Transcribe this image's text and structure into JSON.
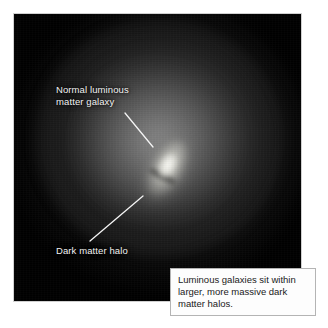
{
  "figure": {
    "alt_title": "Luminous galaxy embedded in a dark matter halo",
    "plate": {
      "background_color": "#000000",
      "halo_glow_color": "#8a8a8a",
      "galaxy_core_color": "#fcfcf8",
      "border_color": "#aaaaaa"
    }
  },
  "annotations": [
    {
      "id": "galaxy",
      "label": "Normal luminous\nmatter galaxy",
      "line1": "Normal luminous",
      "line2": "matter galaxy",
      "text_color": "#f2f2f2",
      "leader": {
        "x1": 125,
        "y1": 113,
        "x2": 153,
        "y2": 147
      }
    },
    {
      "id": "halo",
      "label": "Dark matter halo",
      "line1": "Dark matter halo",
      "line2": "",
      "text_color": "#f2f2f2",
      "leader": {
        "x1": 90,
        "y1": 241,
        "x2": 143,
        "y2": 196
      }
    }
  ],
  "caption": {
    "text": "Luminous galaxies sit within larger, more massive dark matter halos.",
    "border_color": "#b4b4b4",
    "background_color": "#fdfdfd",
    "text_color": "#1a1a1a"
  }
}
